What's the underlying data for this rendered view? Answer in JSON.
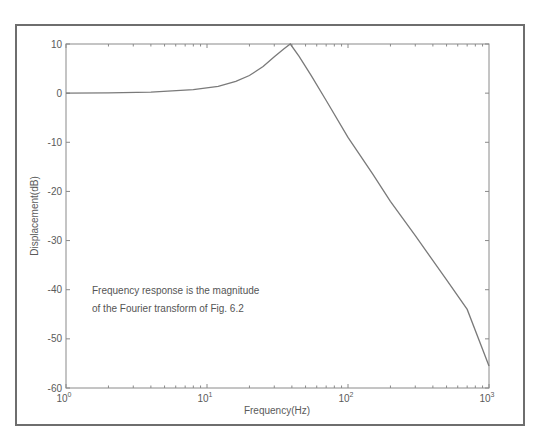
{
  "chart_data": {
    "type": "line",
    "title": "",
    "xlabel": "Frequency(Hz)",
    "ylabel": "Displacement(dB)",
    "xscale": "log",
    "xlim": [
      1,
      1000
    ],
    "ylim": [
      -60,
      10
    ],
    "grid": false,
    "legend": null,
    "x_ticks": [
      {
        "value": 1,
        "base": "10",
        "exp": "0"
      },
      {
        "value": 10,
        "base": "10",
        "exp": "1"
      },
      {
        "value": 100,
        "base": "10",
        "exp": "2"
      },
      {
        "value": 1000,
        "base": "10",
        "exp": "3"
      }
    ],
    "y_ticks": [
      10,
      0,
      -10,
      -20,
      -30,
      -40,
      -50,
      -60
    ],
    "series": [
      {
        "name": "Frequency response",
        "x": [
          1,
          2,
          4,
          8,
          12,
          16,
          20,
          25,
          30,
          35,
          39,
          45,
          55,
          70,
          100,
          150,
          200,
          300,
          500,
          700,
          1000
        ],
        "values": [
          0,
          0.05,
          0.2,
          0.7,
          1.4,
          2.4,
          3.6,
          5.4,
          7.4,
          9.0,
          10.0,
          7.5,
          3.5,
          -1.5,
          -9,
          -16.5,
          -22,
          -29,
          -38,
          -44,
          -55.5
        ]
      }
    ],
    "annotations": [
      "Frequency response is the magnitude",
      "of the Fourier transform of Fig. 6.2"
    ],
    "colors": {
      "line": "#7a7a7a",
      "axes": "#8a8a8a",
      "frame": "#6e6e6e",
      "text": "#5a5a5a"
    }
  }
}
